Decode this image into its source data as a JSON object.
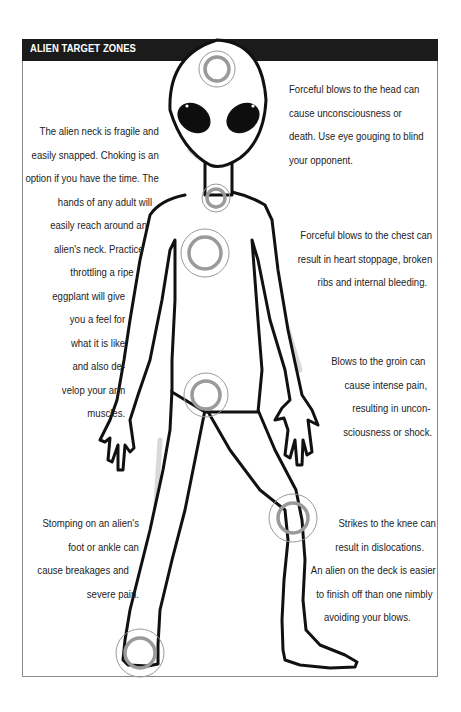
{
  "header": {
    "title": "ALIEN TARGET ZONES"
  },
  "colors": {
    "header_bg": "#1b1b1b",
    "header_text": "#ffffff",
    "border": "#8a8a8a",
    "target_ring": "#9a9a9a",
    "outline": "#111111",
    "shading": "#d9d9d9"
  },
  "figure": {
    "icon": "alien-figure-icon",
    "targets": [
      {
        "zone": "head",
        "cx": 217,
        "cy": 69
      },
      {
        "zone": "neck",
        "cx": 216,
        "cy": 198
      },
      {
        "zone": "chest",
        "cx": 205,
        "cy": 253
      },
      {
        "zone": "groin",
        "cx": 206,
        "cy": 395
      },
      {
        "zone": "knee",
        "cx": 293,
        "cy": 518
      },
      {
        "zone": "foot",
        "cx": 140,
        "cy": 653
      }
    ]
  },
  "notes": {
    "head": {
      "lines": [
        "Forceful blows to the head can",
        "cause unconsciousness or",
        "death. Use eye gouging to blind",
        "your opponent."
      ]
    },
    "neck": {
      "lines": [
        "The alien neck is fragile and",
        "easily snapped. Choking is an",
        "option if you have the time. The",
        "hands of any adult will",
        "easily reach around an",
        "alien's neck. Practice",
        "throttling a ripe",
        "eggplant will give",
        "you a feel for",
        "what it is like",
        "and also de-",
        "velop your arm",
        "muscles."
      ]
    },
    "chest": {
      "lines": [
        "Forceful blows to the chest can",
        "result in heart stoppage, broken",
        "ribs and internal bleeding."
      ]
    },
    "groin": {
      "lines": [
        "Blows to the groin can",
        "cause intense pain,",
        "resulting in uncon-",
        "sciousness or shock."
      ]
    },
    "foot": {
      "lines": [
        "Stomping on an alien's",
        "foot or ankle can",
        "cause breakages and",
        "severe pain."
      ]
    },
    "knee": {
      "lines": [
        "Strikes to the knee can",
        "result in dislocations.",
        "An alien on the deck is easier",
        "to finish off than one nimbly",
        "avoiding your blows."
      ]
    }
  }
}
